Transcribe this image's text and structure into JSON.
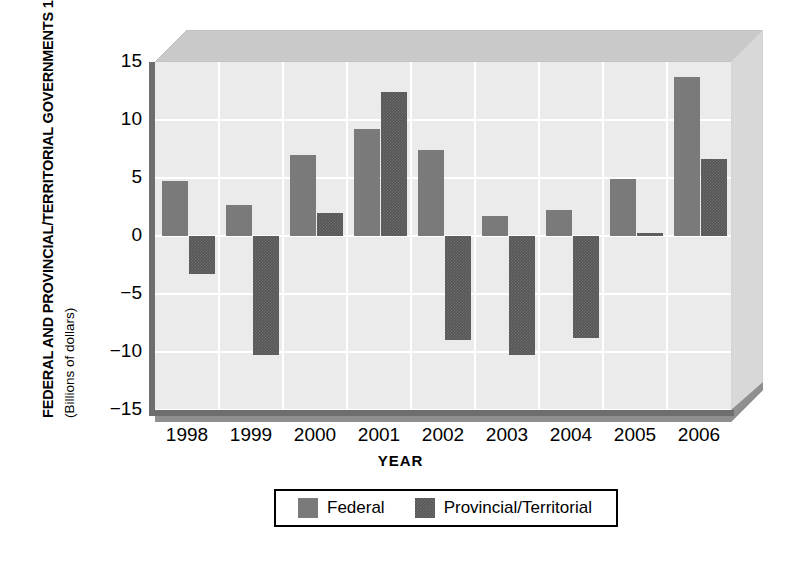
{
  "chart_data": {
    "type": "bar",
    "title": "",
    "ylabel": "FEDERAL AND PROVINCIAL/TERRITORIAL GOVERNMENTS 1998–2006",
    "ylabel_sub": "(Billions of dollars)",
    "xlabel": "YEAR",
    "categories": [
      "1998",
      "1999",
      "2000",
      "2001",
      "2002",
      "2003",
      "2004",
      "2005",
      "2006"
    ],
    "series": [
      {
        "name": "Federal",
        "color": "#7a7a7a",
        "values": [
          4.7,
          2.7,
          7.0,
          9.2,
          7.4,
          1.7,
          2.2,
          4.9,
          13.7
        ]
      },
      {
        "name": "Provincial/Territorial",
        "color": "#555555",
        "values": [
          -3.3,
          -10.3,
          2.0,
          12.4,
          -9.0,
          -10.3,
          -8.8,
          0.3,
          6.6
        ]
      }
    ],
    "ylim": [
      -15,
      15
    ],
    "yticks": [
      "15",
      "10",
      "5",
      "0",
      "-5",
      "-10",
      "-15"
    ],
    "ytick_values": [
      15,
      10,
      5,
      0,
      -5,
      -10,
      -15
    ],
    "grid": true,
    "legend_position": "bottom",
    "plot_background": "#ebebeb",
    "axis_color": "#6e6e6e"
  },
  "legend": {
    "items": [
      {
        "label": "Federal",
        "swatch": "federal-swatch"
      },
      {
        "label": "Provincial/Territorial",
        "swatch": "provincial-swatch"
      }
    ]
  }
}
